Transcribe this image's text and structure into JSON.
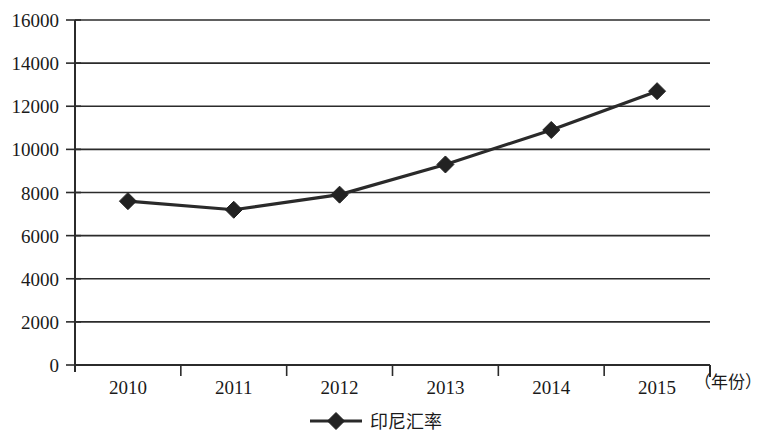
{
  "chart_data": {
    "type": "line",
    "title": "",
    "subtitle": "",
    "xlabel": "（年份）",
    "ylabel": "",
    "categories": [
      "2010",
      "2011",
      "2012",
      "2013",
      "2014",
      "2015"
    ],
    "series": [
      {
        "name": "印尼汇率",
        "values": [
          7600,
          7200,
          7900,
          9300,
          10900,
          12700
        ],
        "marker": "diamond",
        "color": "#222222"
      }
    ],
    "ylim": [
      0,
      16000
    ],
    "yticks": [
      0,
      2000,
      4000,
      6000,
      8000,
      10000,
      12000,
      14000,
      16000
    ],
    "ytick_labels": [
      "0",
      "2000",
      "4000",
      "6000",
      "8000",
      "10000",
      "12000",
      "14000",
      "16000"
    ],
    "grid": true,
    "grid_axis": "y",
    "legend": {
      "position": "bottom",
      "entries": [
        "印尼汇率"
      ]
    },
    "axis_unit_note": "（年份）",
    "frame": "left-and-right-open",
    "background": "#ffffff"
  }
}
